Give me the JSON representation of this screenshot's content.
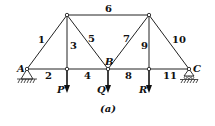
{
  "figure": {
    "caption": "(a)",
    "nodes": {
      "A": "A",
      "B": "B",
      "C": "C"
    },
    "members": {
      "m1": "1",
      "m2": "2",
      "m3": "3",
      "m4": "4",
      "m5": "5",
      "m6": "6",
      "m7": "7",
      "m8": "8",
      "m9": "9",
      "m10": "10",
      "m11": "11"
    },
    "loads": {
      "P": "P",
      "Q": "Q",
      "R": "R"
    },
    "supports": {
      "left": "pin-support",
      "right": "roller-support"
    }
  }
}
